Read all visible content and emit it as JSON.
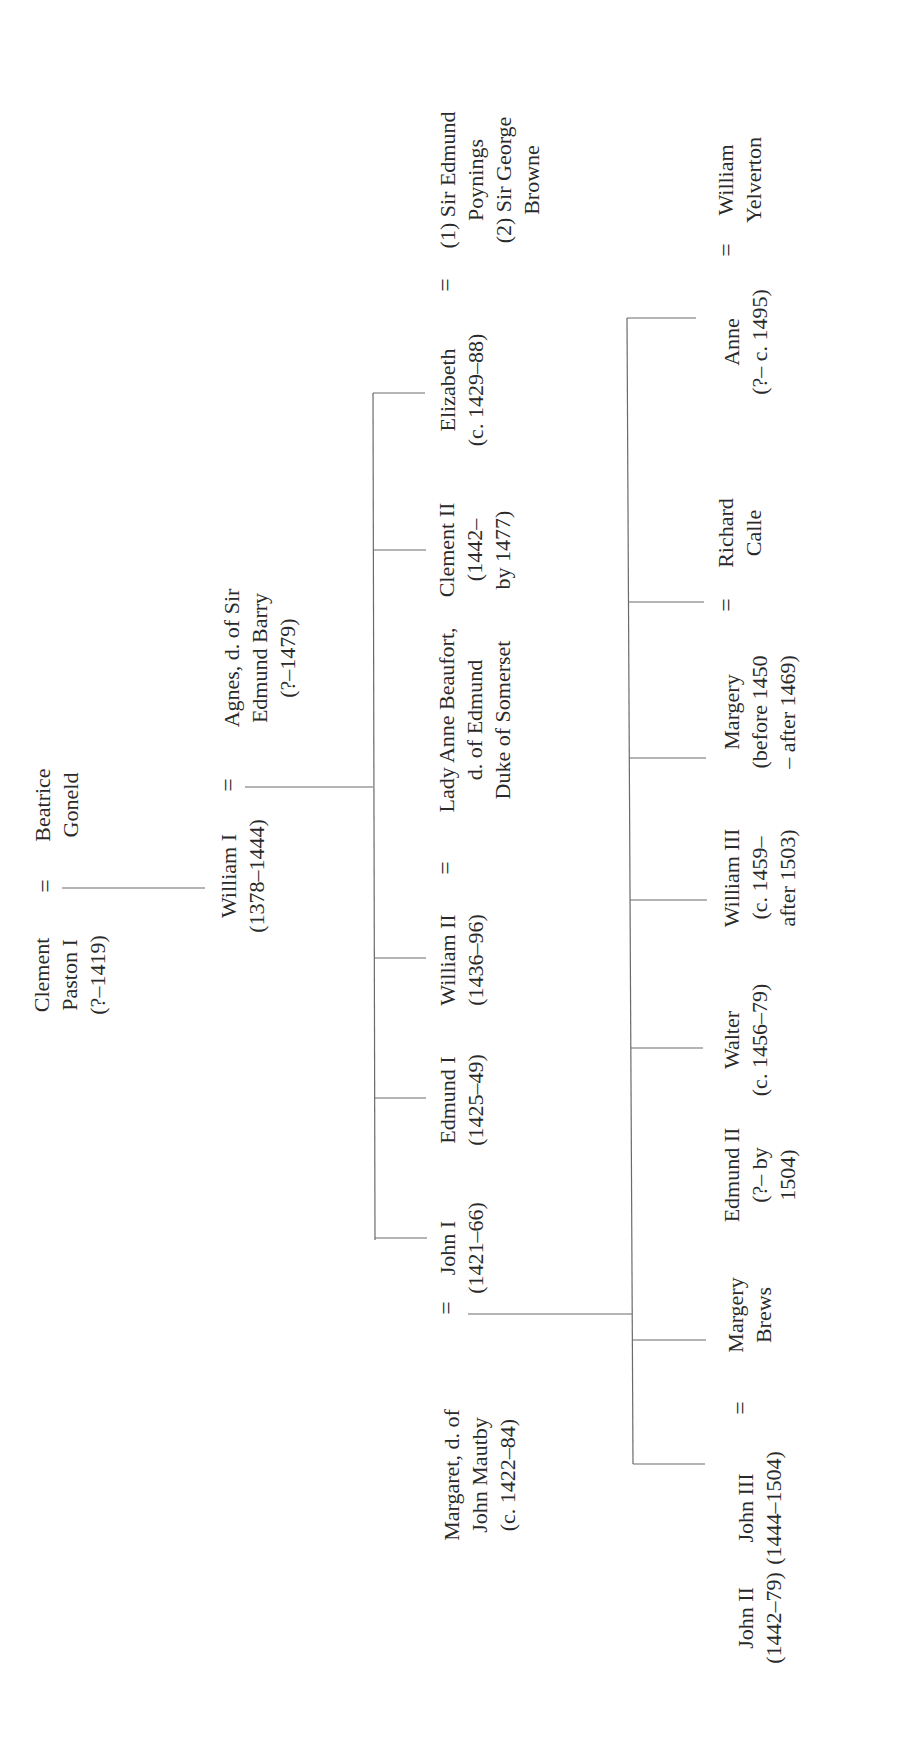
{
  "diagram": {
    "type": "family-tree",
    "orientation": "rotated-90-ccw",
    "line_color": "#6a6a6a",
    "text_color": "#2a2a2a",
    "marriage_symbol": "="
  },
  "generation_0": {
    "husband": {
      "lines": [
        "Clement",
        "Paston I",
        "(?–1419)"
      ]
    },
    "wife": {
      "lines": [
        "Beatrice",
        "Goneld"
      ]
    }
  },
  "generation_1": {
    "husband": {
      "lines": [
        "William I",
        "(1378–1444)"
      ]
    },
    "wife": {
      "lines": [
        "Agnes, d. of Sir",
        "Edmund Barry",
        "(?–1479)"
      ]
    }
  },
  "generation_2": {
    "children": [
      {
        "lines": [
          "John I",
          "(1421–66)"
        ]
      },
      {
        "lines": [
          "Edmund I",
          "(1425–49)"
        ]
      },
      {
        "lines": [
          "William II",
          "(1436–96)"
        ]
      },
      {
        "lines": [
          "Clement II",
          "(1442–",
          "by 1477)"
        ]
      },
      {
        "lines": [
          "Elizabeth",
          "(c. 1429–88)"
        ]
      }
    ],
    "spouses": {
      "john_i": {
        "lines": [
          "Margaret, d. of",
          "John Mautby",
          "(c. 1422–84)"
        ]
      },
      "william_ii": {
        "lines": [
          "Lady Anne Beaufort,",
          "d. of Edmund",
          "Duke of Somerset"
        ]
      },
      "elizabeth": {
        "lines": [
          "(1) Sir Edmund",
          "Poynings",
          "(2) Sir George",
          "Browne"
        ]
      }
    }
  },
  "generation_3": {
    "children": [
      {
        "lines": [
          "John II",
          "(1442–79)"
        ]
      },
      {
        "lines": [
          "John III",
          "(1444–1504)"
        ]
      },
      {
        "lines": [
          "Edmund II",
          "(?– by",
          "1504)"
        ]
      },
      {
        "lines": [
          "Walter",
          "(c. 1456–79)"
        ]
      },
      {
        "lines": [
          "William III",
          "(c. 1459–",
          "after 1503)"
        ]
      },
      {
        "lines": [
          "Margery",
          "(before 1450",
          "– after 1469)"
        ]
      },
      {
        "lines": [
          "Anne",
          "(?– c. 1495)"
        ]
      }
    ],
    "spouses": {
      "john_iii": {
        "lines": [
          "Margery",
          "Brews"
        ]
      },
      "margery": {
        "lines": [
          "Richard",
          "Calle"
        ]
      },
      "anne": {
        "lines": [
          "William",
          "Yelverton"
        ]
      }
    }
  }
}
